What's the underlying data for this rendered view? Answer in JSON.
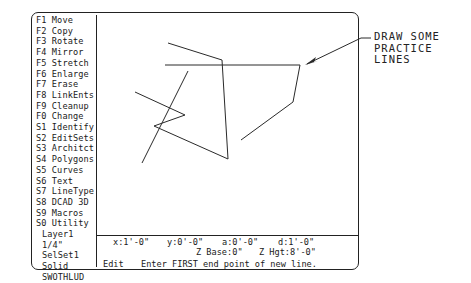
{
  "menu": {
    "items": [
      {
        "key": "F1",
        "label": "Move"
      },
      {
        "key": "F2",
        "label": "Copy"
      },
      {
        "key": "F3",
        "label": "Rotate"
      },
      {
        "key": "F4",
        "label": "Mirror"
      },
      {
        "key": "F5",
        "label": "Stretch"
      },
      {
        "key": "F6",
        "label": "Enlarge"
      },
      {
        "key": "F7",
        "label": "Erase"
      },
      {
        "key": "F8",
        "label": "LinkEnts"
      },
      {
        "key": "F9",
        "label": "Cleanup"
      },
      {
        "key": "F0",
        "label": "Change"
      },
      {
        "key": "S1",
        "label": "Identify"
      },
      {
        "key": "S2",
        "label": "EditSets"
      },
      {
        "key": "S3",
        "label": "Architct"
      },
      {
        "key": "S4",
        "label": "Polygons"
      },
      {
        "key": "S5",
        "label": "Curves"
      },
      {
        "key": "S6",
        "label": "Text"
      },
      {
        "key": "S7",
        "label": "LineType"
      },
      {
        "key": "S8",
        "label": "DCAD 3D"
      },
      {
        "key": "S9",
        "label": "Macros"
      },
      {
        "key": "S0",
        "label": "Utility"
      }
    ],
    "status": {
      "layer": "Layer1",
      "scale": "1/4\"",
      "selset": "SelSet1",
      "fill": "Solid",
      "flags": "SWOTHLUD"
    }
  },
  "coordinates": {
    "x": "x:1'-0\"",
    "y": "y:0'-0\"",
    "angle": "a:0'-0\"",
    "distance": "d:1'-0\"",
    "z_base": "Z Base:0\"",
    "z_height": "Z Hgt:8'-0\""
  },
  "prompt": {
    "mode": "Edit",
    "message": "Enter FIRST end point of new line."
  },
  "callout": {
    "lines": [
      "DRAW SOME",
      "PRACTICE",
      "LINES"
    ]
  },
  "drawing": {
    "polylines": [
      [
        [
          135,
          92
        ],
        [
          185,
          115
        ],
        [
          154,
          126
        ],
        [
          228,
          159
        ],
        [
          222,
          60
        ],
        [
          168,
          43
        ]
      ],
      [
        [
          188,
          71
        ],
        [
          142,
          163
        ]
      ],
      [
        [
          165,
          65
        ],
        [
          300,
          65
        ],
        [
          293,
          102
        ],
        [
          241,
          140
        ]
      ]
    ]
  }
}
